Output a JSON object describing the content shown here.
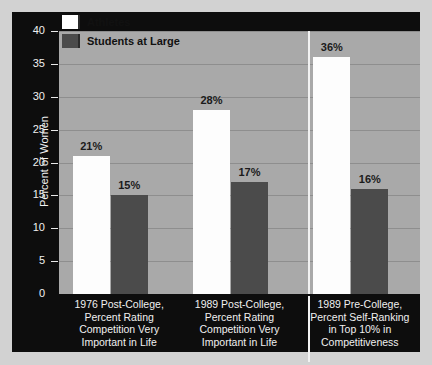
{
  "chart_data": {
    "type": "bar",
    "title": "",
    "xlabel": "",
    "ylabel": "Percent of Women",
    "ylim": [
      0,
      40
    ],
    "ytick_values": [
      0,
      5,
      10,
      15,
      20,
      25,
      30,
      35,
      40
    ],
    "ytick_labels": [
      "0",
      "5",
      "10",
      "15",
      "20",
      "25",
      "30",
      "35",
      "40"
    ],
    "grid": true,
    "legend_position": "top-left",
    "categories": [
      "1976 Post-College, Percent Rating Competition Very Important in Life",
      "1989 Post-College, Percent Rating Competition Very Important in Life",
      "1989 Pre-College, Percent Self-Ranking in Top 10% in Competitiveness"
    ],
    "category_lines": [
      [
        "1976 Post-College,",
        "Percent Rating",
        "Competition Very",
        "Important in Life"
      ],
      [
        "1989 Post-College,",
        "Percent Rating",
        "Competition Very",
        "Important in Life"
      ],
      [
        "1989 Pre-College,",
        "Percent Self-Ranking",
        "in Top 10% in",
        "Competitiveness"
      ]
    ],
    "series": [
      {
        "name": "Athletes",
        "color": "#ffffff",
        "values": [
          21,
          28,
          36
        ],
        "labels": [
          "21%",
          "28%",
          "36%"
        ]
      },
      {
        "name": "Students at Large",
        "color": "#4b4b4b",
        "values": [
          15,
          17,
          16
        ],
        "labels": [
          "15%",
          "17%",
          "16%"
        ]
      }
    ]
  },
  "legend": {
    "items": [
      {
        "label": "Athletes",
        "swatch": "athletes"
      },
      {
        "label": "Students at Large",
        "swatch": "students"
      }
    ]
  },
  "colors": {
    "panel_background": "#0d0d0d",
    "plot_background": "#a9a9a9",
    "gridline": "#8e8e8e",
    "athletes_bar": "#ffffff",
    "students_bar": "#4b4b4b",
    "axis_text": "#f0f0f0",
    "value_text": "#1b1b1b"
  }
}
